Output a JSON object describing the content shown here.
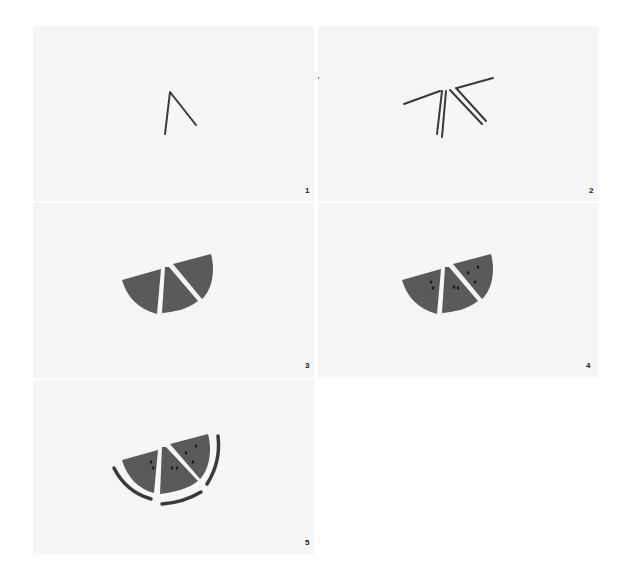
{
  "colors": {
    "panel_bg": "#f6f6f6",
    "stroke": "#3a3a3a",
    "fill": "#5a5a5a",
    "seed": "#1e1e1e"
  },
  "steps": [
    {
      "number": "1",
      "description": "Draw an inverted V shape"
    },
    {
      "number": "2",
      "description": "Add parallel lines and a top line for the slice edges"
    },
    {
      "number": "3",
      "description": "Shade the three wedge segments"
    },
    {
      "number": "4",
      "description": "Add seeds in each wedge"
    },
    {
      "number": "5",
      "description": "Draw the rind arcs along the bottom"
    }
  ]
}
